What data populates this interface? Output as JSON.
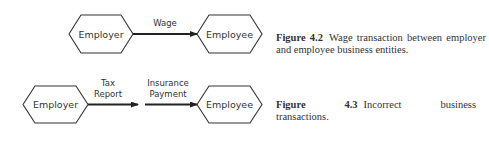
{
  "figure_4_2": {
    "nodes": {
      "employer": "Employer",
      "employee": "Employee"
    },
    "edges": [
      {
        "label": "Wage",
        "from": "Employer",
        "to": "Employee"
      }
    ],
    "caption": {
      "number": "Figure 4.2",
      "text": "Wage transaction between employer and employee business entities."
    }
  },
  "figure_4_3": {
    "nodes": {
      "employer": "Employer",
      "employee": "Employee"
    },
    "edges": [
      {
        "label_line1": "Tax",
        "label_line2": "Report"
      },
      {
        "label_line1": "Insurance",
        "label_line2": "Payment"
      }
    ],
    "caption": {
      "number": "Figure 4.3",
      "text": "Incorrect business transactions."
    }
  },
  "colors": {
    "stroke": "#333333",
    "arrow": "#222222",
    "background": "#ffffff"
  }
}
